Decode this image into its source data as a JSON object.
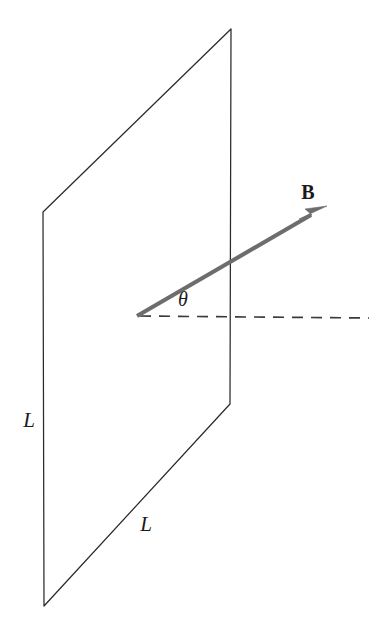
{
  "figure": {
    "background_color": "#ffffff",
    "width": 384,
    "height": 634
  },
  "colors": {
    "plane_stroke": "#2a2a2a",
    "dashed_axis": "#3a3a3a",
    "b_vector": "#6d6d6d",
    "label": "#1a1a1a",
    "background": "#ffffff"
  },
  "plane": {
    "name": "square-loop-plane",
    "shape": "parallelogram",
    "corners": {
      "top_left": [
        43,
        212
      ],
      "top_right": [
        231,
        29
      ],
      "bottom_right": [
        230,
        404
      ],
      "bottom_left": [
        44,
        606
      ]
    },
    "path": "M 43 212 L 231 29 L 230 404 L 44 606 Z"
  },
  "labels": {
    "side_left": {
      "text": "L",
      "x": 29,
      "y": 427,
      "anchor": "middle",
      "style": "italic-serif",
      "describes": "vertical side length of the loop"
    },
    "side_bottom": {
      "text": "L",
      "x": 146,
      "y": 531,
      "anchor": "middle",
      "style": "italic-serif",
      "describes": "horizontal (receding) side length of the loop"
    },
    "angle": {
      "text": "θ",
      "x": 183,
      "y": 306,
      "anchor": "middle",
      "style": "italic-serif",
      "describes": "angle between B and the dashed normal reference line"
    },
    "field_vector": {
      "text": "B",
      "x": 308,
      "y": 199,
      "anchor": "middle",
      "style": "bold-serif",
      "describes": "magnetic field vector label"
    }
  },
  "b_vector": {
    "name": "magnetic-field-vector",
    "tail": [
      137,
      316
    ],
    "tip": [
      327,
      206
    ],
    "shaft_end": [
      313,
      214
    ],
    "angle_degrees": 30,
    "stroke_width": 4.1,
    "arrowhead": "M 327 206 L 305 209 L 312 215 L 299 219 Z"
  },
  "dashed_axis": {
    "name": "horizontal-reference-line",
    "start": [
      140,
      316
    ],
    "end": [
      369,
      318
    ],
    "dash_pattern": "11 8"
  }
}
